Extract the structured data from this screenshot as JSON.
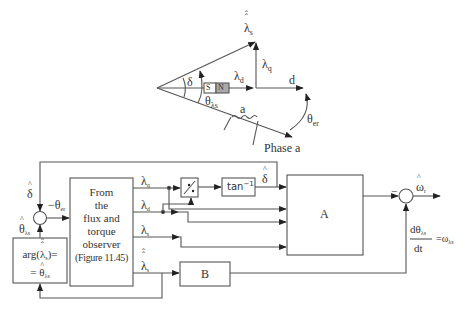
{
  "vector_diagram": {
    "stator_flux_label": "λ",
    "stator_flux_sub": "s",
    "lambda_q_label": "λ",
    "lambda_q_sub": "q",
    "lambda_d_label": "λ",
    "lambda_d_sub": "d",
    "d_axis_label": "d",
    "delta_label": "δ",
    "theta_lambda_s_label": "θ",
    "theta_lambda_s_sub": "λs",
    "phase_winding_label": "a",
    "phase_axis_label": "Phase a",
    "theta_er_label": "θ",
    "theta_er_sub": "er",
    "magnet_s": "S",
    "magnet_n": "N"
  },
  "block_diagram": {
    "observer_block": {
      "lines": [
        "From",
        "the",
        "flux and",
        "torque",
        "observer",
        "(Figure 11.45)"
      ]
    },
    "arg_block": {
      "line1_prefix": "arg(",
      "line1_symbol": "λ",
      "line1_sub": "s",
      "line1_suffix": ")=",
      "line2_prefix": "=",
      "line2_symbol": "θ",
      "line2_sub": "λs"
    },
    "divider_block": "÷",
    "arctan_block": {
      "text": "tan",
      "sup": "−1"
    },
    "block_a": "A",
    "block_b": "B",
    "signals": {
      "delta_hat_feedback": "δ",
      "neg_theta_er": "−θ",
      "neg_theta_er_sub": "er",
      "theta_lambda_s": "θ",
      "theta_lambda_s_sub": "λs",
      "lambda_q": "λ",
      "lambda_q_sub": "q",
      "lambda_d": "λ",
      "lambda_d_sub": "d",
      "lambda_s": "λ",
      "lambda_s_sub": "s",
      "lambda_s_vec": "λ",
      "lambda_s_vec_sub": "s",
      "delta_hat_out": "δ",
      "omega_r": "ω",
      "omega_r_sub": "r",
      "minus_sign": "−",
      "dtheta_num": "dθ",
      "dtheta_num_sub": "λs",
      "dtheta_den": "dt",
      "dtheta_eq": "=ω",
      "dtheta_eq_sub": "λs"
    }
  }
}
